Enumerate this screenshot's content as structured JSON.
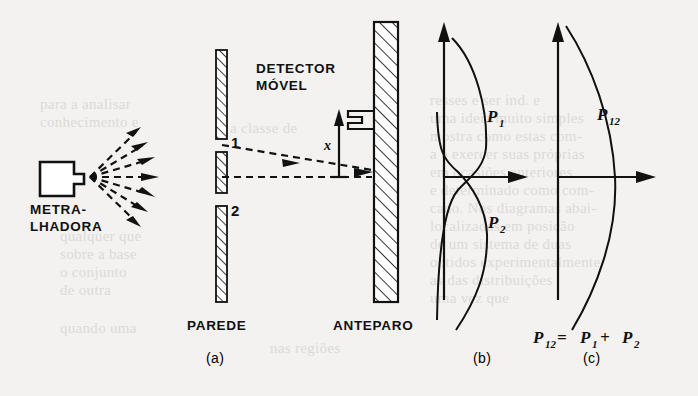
{
  "figure": {
    "caption_language": "pt-BR",
    "background_color": "#f3f2f0",
    "ink_color": "#111111",
    "panels": [
      {
        "id": "a",
        "label": "(a)"
      },
      {
        "id": "b",
        "label": "(b)"
      },
      {
        "id": "c",
        "label": "(c)"
      }
    ]
  },
  "panel_a": {
    "source_label_line1": "METRA-",
    "source_label_line2": "LHADORA",
    "wall_label": "PAREDE",
    "screen_label": "ANTEPARO",
    "detector_label_line1": "DETECTOR",
    "detector_label_line2": "MÓVEL",
    "slit_1_label": "1",
    "slit_2_label": "2",
    "axis_label": "x",
    "ray_count": 7
  },
  "panel_b": {
    "curve_1_label": "P",
    "curve_1_sub": "1",
    "curve_2_label": "P",
    "curve_2_sub": "2",
    "panel_label": "(b)"
  },
  "panel_c": {
    "curve_label": "P",
    "curve_sub": "12",
    "equation_parts": [
      "P",
      "12",
      " = ",
      "P",
      "1",
      " + ",
      "P",
      "2"
    ],
    "equation_text": "P12 = P1 + P2",
    "panel_label": "(c)"
  },
  "chart_data": {
    "type": "line",
    "title": "",
    "charts": [
      {
        "panel": "b",
        "xlabel": "",
        "ylabel": "x",
        "grid": false,
        "legend": "inline-annotation",
        "series": [
          {
            "name": "P1",
            "description": "probability distribution through slit 1 alone; peak above axis, crossing axis at origin",
            "x": [
              0.1,
              0.45,
              0.72,
              0.86,
              0.9,
              0.8,
              0.55,
              0.26,
              0.1,
              0.04
            ],
            "y": [
              1.0,
              0.8,
              0.58,
              0.38,
              0.18,
              0.0,
              -0.22,
              -0.5,
              -0.78,
              -1.0
            ]
          },
          {
            "name": "P2",
            "description": "probability distribution through slit 2 alone; mirror of P1, peak below axis",
            "x": [
              0.04,
              0.1,
              0.26,
              0.55,
              0.8,
              0.9,
              0.86,
              0.72,
              0.45,
              0.1
            ],
            "y": [
              1.0,
              0.78,
              0.5,
              0.22,
              0.0,
              -0.18,
              -0.38,
              -0.58,
              -0.8,
              -1.0
            ]
          }
        ],
        "xlim": [
          0,
          1.1
        ],
        "ylim": [
          -1.1,
          1.1
        ]
      },
      {
        "panel": "c",
        "xlabel": "",
        "ylabel": "x",
        "grid": false,
        "legend": "inline-annotation",
        "series": [
          {
            "name": "P12",
            "description": "sum distribution P12 = P1 + P2; single broad bell peaked at the axis",
            "x": [
              0.12,
              0.42,
              0.7,
              0.88,
              0.96,
              1.0,
              0.96,
              0.88,
              0.7,
              0.42,
              0.12
            ],
            "y": [
              1.0,
              0.82,
              0.62,
              0.4,
              0.2,
              0.0,
              -0.2,
              -0.4,
              -0.62,
              -0.82,
              -1.0
            ]
          }
        ],
        "xlim": [
          0,
          1.1
        ],
        "ylim": [
          -1.1,
          1.1
        ]
      }
    ]
  },
  "background_bleed": [
    {
      "text": "resses e ser ind. e",
      "x": 430,
      "y": 92
    },
    {
      "text": "uma ideia muito simples",
      "x": 430,
      "y": 110
    },
    {
      "text": "mostra como estas com-",
      "x": 430,
      "y": 128
    },
    {
      "text": "a e exercer suas próprias",
      "x": 430,
      "y": 146
    },
    {
      "text": "em ocasiões anteriores",
      "x": 430,
      "y": 164
    },
    {
      "text": "e determinado como com-",
      "x": 430,
      "y": 182
    },
    {
      "text": "cado. Nos diagramas abai-",
      "x": 430,
      "y": 200
    },
    {
      "text": "localizadas em posição",
      "x": 430,
      "y": 218
    },
    {
      "text": "de um sistema de duas",
      "x": 430,
      "y": 236
    },
    {
      "text": "obtidos experimentalmente",
      "x": 430,
      "y": 254
    },
    {
      "text": "as das distribuições",
      "x": 430,
      "y": 272
    },
    {
      "text": "uma vez que",
      "x": 430,
      "y": 290
    },
    {
      "text": "para a analisar",
      "x": 40,
      "y": 96
    },
    {
      "text": "conhecimento e",
      "x": 40,
      "y": 114
    },
    {
      "text": "a classe de",
      "x": 230,
      "y": 120
    },
    {
      "text": "qualquer que",
      "x": 60,
      "y": 228
    },
    {
      "text": "sobre a base",
      "x": 60,
      "y": 246
    },
    {
      "text": "o conjunto",
      "x": 60,
      "y": 264
    },
    {
      "text": "de outra",
      "x": 60,
      "y": 282
    },
    {
      "text": "nas regiões",
      "x": 270,
      "y": 340
    },
    {
      "text": "quando uma",
      "x": 60,
      "y": 320
    }
  ]
}
